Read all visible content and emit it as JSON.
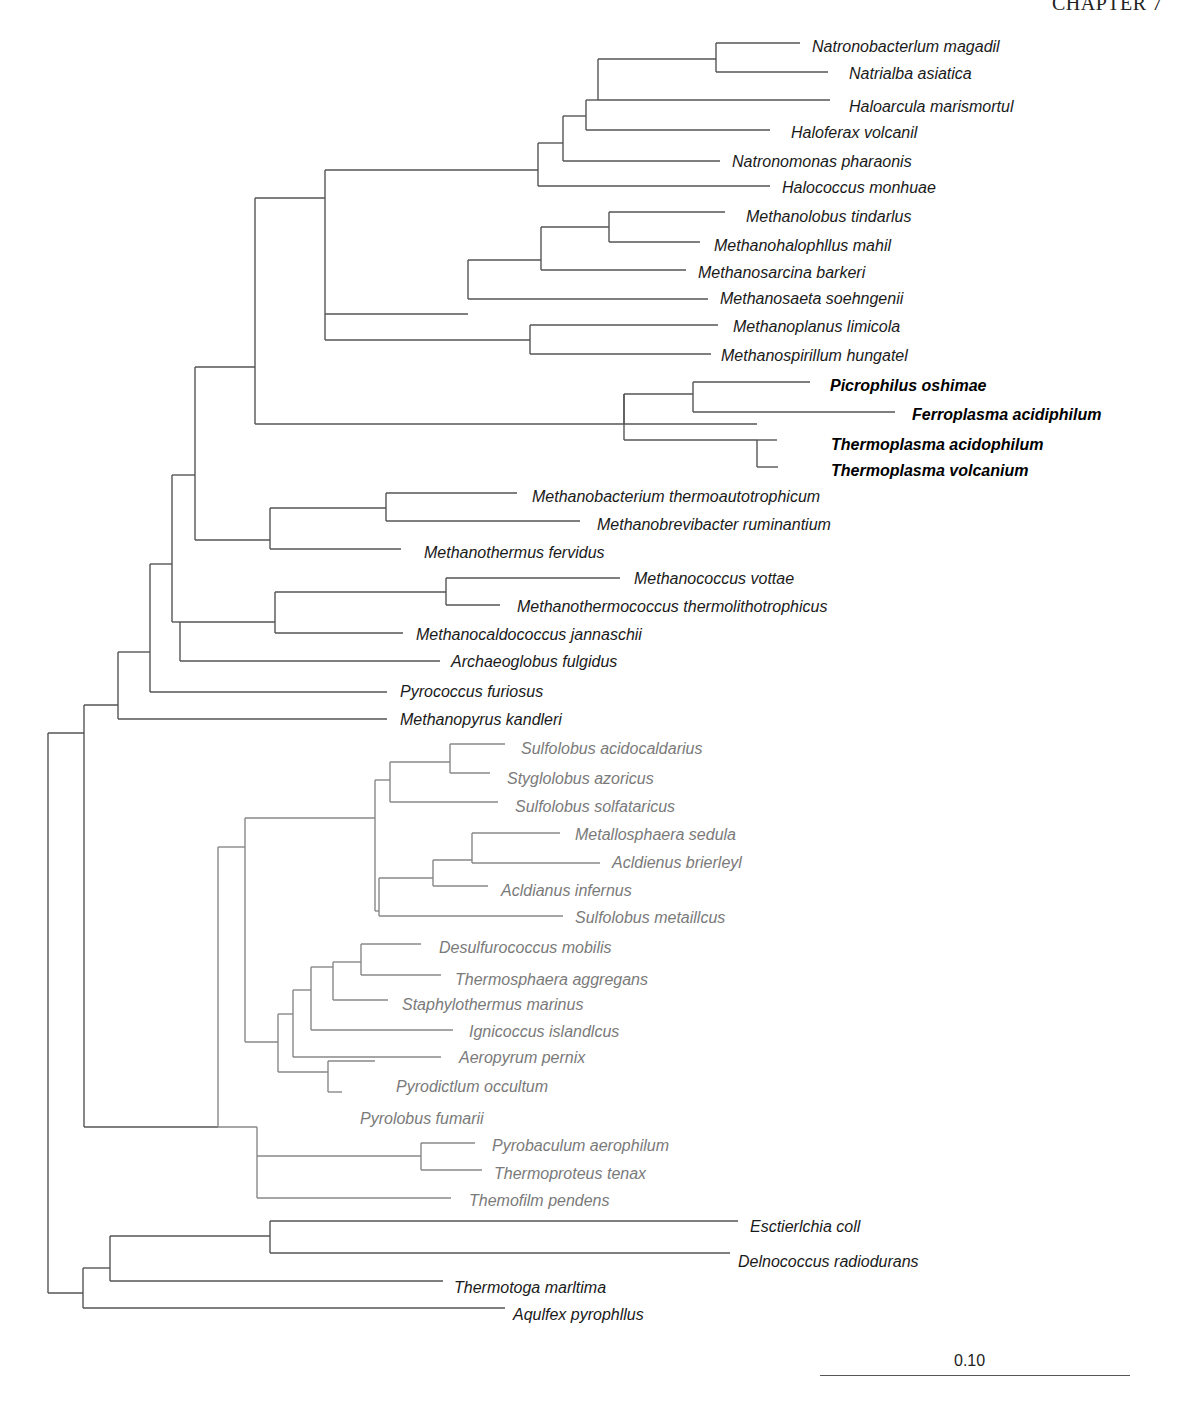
{
  "header": {
    "text": "CHAPTER 7"
  },
  "scale": {
    "label": "0.10"
  },
  "taxa": [
    {
      "name": "Natronobacterlum magadil",
      "group": "euryarchaeota",
      "style": "black",
      "x": 812,
      "y": 47
    },
    {
      "name": "Natrialba asiatica",
      "group": "euryarchaeota",
      "style": "black",
      "x": 849,
      "y": 74
    },
    {
      "name": "Haloarcula marismortul",
      "group": "euryarchaeota",
      "style": "black",
      "x": 849,
      "y": 107
    },
    {
      "name": "Haloferax volcanil",
      "group": "euryarchaeota",
      "style": "black",
      "x": 791,
      "y": 133
    },
    {
      "name": "Natronomonas pharaonis",
      "group": "euryarchaeota",
      "style": "black",
      "x": 732,
      "y": 162
    },
    {
      "name": "Halococcus monhuae",
      "group": "euryarchaeota",
      "style": "black",
      "x": 782,
      "y": 188
    },
    {
      "name": "Methanolobus tindarlus",
      "group": "euryarchaeota",
      "style": "black",
      "x": 746,
      "y": 217
    },
    {
      "name": "Methanohalophllus mahil",
      "group": "euryarchaeota",
      "style": "black",
      "x": 714,
      "y": 246
    },
    {
      "name": "Methanosarcina barkeri",
      "group": "euryarchaeota",
      "style": "black",
      "x": 698,
      "y": 273
    },
    {
      "name": "Methanosaeta soehngenii",
      "group": "euryarchaeota",
      "style": "black",
      "x": 720,
      "y": 299
    },
    {
      "name": "Methanoplanus limicola",
      "group": "euryarchaeota",
      "style": "black",
      "x": 733,
      "y": 327
    },
    {
      "name": "Methanospirillum hungatel",
      "group": "euryarchaeota",
      "style": "black",
      "x": 721,
      "y": 356
    },
    {
      "name": "Picrophilus oshimae",
      "group": "thermoplasmata",
      "style": "bold",
      "x": 830,
      "y": 386
    },
    {
      "name": "Ferroplasma acidiphilum",
      "group": "thermoplasmata",
      "style": "bold",
      "x": 912,
      "y": 415
    },
    {
      "name": "Thermoplasma acidophilum",
      "group": "thermoplasmata",
      "style": "bold",
      "x": 831,
      "y": 445
    },
    {
      "name": "Thermoplasma volcanium",
      "group": "thermoplasmata",
      "style": "bold",
      "x": 831,
      "y": 471
    },
    {
      "name": "Methanobacterium thermoautotrophicum",
      "group": "euryarchaeota",
      "style": "black",
      "x": 532,
      "y": 497
    },
    {
      "name": "Methanobrevibacter ruminantium",
      "group": "euryarchaeota",
      "style": "black",
      "x": 597,
      "y": 525
    },
    {
      "name": "Methanothermus fervidus",
      "group": "euryarchaeota",
      "style": "black",
      "x": 424,
      "y": 553
    },
    {
      "name": "Methanococcus vottae",
      "group": "euryarchaeota",
      "style": "black",
      "x": 634,
      "y": 579
    },
    {
      "name": "Methanothermococcus thermolithotrophicus",
      "group": "euryarchaeota",
      "style": "black",
      "x": 517,
      "y": 607
    },
    {
      "name": "Methanocaldococcus jannaschii",
      "group": "euryarchaeota",
      "style": "black",
      "x": 416,
      "y": 635
    },
    {
      "name": "Archaeoglobus fulgidus",
      "group": "euryarchaeota",
      "style": "black",
      "x": 451,
      "y": 662
    },
    {
      "name": "Pyrococcus furiosus",
      "group": "euryarchaeota",
      "style": "black",
      "x": 400,
      "y": 692
    },
    {
      "name": "Methanopyrus kandleri",
      "group": "euryarchaeota",
      "style": "black",
      "x": 400,
      "y": 720
    },
    {
      "name": "Sulfolobus acidocaldarius",
      "group": "crenarchaeota",
      "style": "gray",
      "x": 521,
      "y": 749
    },
    {
      "name": "Styglolobus azoricus",
      "group": "crenarchaeota",
      "style": "gray",
      "x": 507,
      "y": 779
    },
    {
      "name": "Sulfolobus solfataricus",
      "group": "crenarchaeota",
      "style": "gray",
      "x": 515,
      "y": 807
    },
    {
      "name": "Metallosphaera sedula",
      "group": "crenarchaeota",
      "style": "gray",
      "x": 575,
      "y": 835
    },
    {
      "name": "Acldienus brierleyl",
      "group": "crenarchaeota",
      "style": "gray",
      "x": 612,
      "y": 863
    },
    {
      "name": "Acldianus infernus",
      "group": "crenarchaeota",
      "style": "gray",
      "x": 501,
      "y": 891
    },
    {
      "name": "Sulfolobus metaillcus",
      "group": "crenarchaeota",
      "style": "gray",
      "x": 575,
      "y": 918
    },
    {
      "name": "Desulfurococcus mobilis",
      "group": "crenarchaeota",
      "style": "gray",
      "x": 439,
      "y": 948
    },
    {
      "name": "Thermosphaera aggregans",
      "group": "crenarchaeota",
      "style": "gray",
      "x": 455,
      "y": 980
    },
    {
      "name": "Staphylothermus marinus",
      "group": "crenarchaeota",
      "style": "gray",
      "x": 402,
      "y": 1005
    },
    {
      "name": "Ignicoccus islandlcus",
      "group": "crenarchaeota",
      "style": "gray",
      "x": 469,
      "y": 1032
    },
    {
      "name": "Aeropyrum pernix",
      "group": "crenarchaeota",
      "style": "gray",
      "x": 459,
      "y": 1058
    },
    {
      "name": "Pyrodictlum occultum",
      "group": "crenarchaeota",
      "style": "gray",
      "x": 396,
      "y": 1087
    },
    {
      "name": "Pyrolobus fumarii",
      "group": "crenarchaeota",
      "style": "gray",
      "x": 360,
      "y": 1119
    },
    {
      "name": "Pyrobaculum aerophilum",
      "group": "crenarchaeota",
      "style": "gray",
      "x": 492,
      "y": 1146
    },
    {
      "name": "Thermoproteus tenax",
      "group": "crenarchaeota",
      "style": "gray",
      "x": 494,
      "y": 1174
    },
    {
      "name": "Themofilm pendens",
      "group": "crenarchaeota",
      "style": "gray",
      "x": 469,
      "y": 1201
    },
    {
      "name": "Esctierlchia coll",
      "group": "bacteria",
      "style": "black",
      "x": 750,
      "y": 1227
    },
    {
      "name": "Delnococcus radiodurans",
      "group": "bacteria",
      "style": "black",
      "x": 738,
      "y": 1262
    },
    {
      "name": "Thermotoga marltima",
      "group": "bacteria",
      "style": "black",
      "x": 454,
      "y": 1288
    },
    {
      "name": "Aqulfex pyrophllus",
      "group": "bacteria",
      "style": "black",
      "x": 513,
      "y": 1315
    }
  ],
  "chart_data": {
    "type": "table",
    "scale_bar": {
      "label": "0.10",
      "length_px": 310
    },
    "groups": {
      "euryarchaeota_halobacteria": [
        "Natronobacterlum magadil",
        "Natrialba asiatica",
        "Haloarcula marismortul",
        "Haloferax volcanil",
        "Natronomonas pharaonis",
        "Halococcus monhuae"
      ],
      "euryarchaeota_methanosarcinales": [
        "Methanolobus tindarlus",
        "Methanohalophllus mahil",
        "Methanosarcina barkeri",
        "Methanosaeta soehngenii"
      ],
      "euryarchaeota_methanomicrobiales": [
        "Methanoplanus limicola",
        "Methanospirillum hungatel"
      ],
      "thermoplasmata_highlighted": [
        "Picrophilus oshimae",
        "Ferroplasma acidiphilum",
        "Thermoplasma acidophilum",
        "Thermoplasma volcanium"
      ],
      "euryarchaeota_methanobacteriales": [
        "Methanobacterium thermoautotrophicum",
        "Methanobrevibacter ruminantium",
        "Methanothermus fervidus"
      ],
      "euryarchaeota_methanococcales_archaeoglobales": [
        "Methanococcus vottae",
        "Methanothermococcus thermolithotrophicus",
        "Methanocaldococcus jannaschii",
        "Archaeoglobus fulgidus"
      ],
      "euryarchaeota_basal": [
        "Pyrococcus furiosus",
        "Methanopyrus kandleri"
      ],
      "crenarchaeota_sulfolobales": [
        "Sulfolobus acidocaldarius",
        "Styglolobus azoricus",
        "Sulfolobus solfataricus",
        "Metallosphaera sedula",
        "Acldienus brierleyl",
        "Acldianus infernus",
        "Sulfolobus metaillcus"
      ],
      "crenarchaeota_desulfurococcales": [
        "Desulfurococcus mobilis",
        "Thermosphaera aggregans",
        "Staphylothermus marinus",
        "Ignicoccus islandlcus",
        "Aeropyrum pernix",
        "Pyrodictlum occultum",
        "Pyrolobus fumarii"
      ],
      "crenarchaeota_thermoproteales": [
        "Pyrobaculum aerophilum",
        "Thermoproteus tenax",
        "Themofilm pendens"
      ],
      "bacteria_outgroup": [
        "Esctierlchia coll",
        "Delnococcus radiodurans",
        "Thermotoga marltima",
        "Aqulfex pyrophllus"
      ]
    },
    "newick": "((((((((((Natronobacterlum_magadil,Natrialba_asiatica),Haloarcula_marismortul),Haloferax_volcanil),Natronomonas_pharaonis),Halococcus_monhuae),(((Methanolobus_tindarlus,Methanohalophllus_mahil),Methanosarcina_barkeri),Methanosaeta_soehngenii),(Methanoplanus_limicola,Methanospirillum_hungatel)),((Picrophilus_oshimae,Ferroplasma_acidiphilum),(Thermoplasma_acidophilum,Thermoplasma_volcanium))),((Methanobacterium_thermoautotrophicum,Methanobrevibacter_ruminantium),Methanothermus_fervidus)),(((Methanococcus_vottae,Methanothermococcus_thermolithotrophicus),Methanocaldococcus_jannaschii),Archaeoglobus_fulgidus)),Pyrococcus_furiosus),Methanopyrus_kandleri),((((Sulfolobus_acidocaldarius,Styglolobus_azoricus),Sulfolobus_solfataricus),(((Metallosphaera_sedula,Acldienus_brierleyl),Acldianus_infernus),Sulfolobus_metaillcus)),(((((Desulfurococcus_mobilis,Thermosphaera_aggregans),Staphylothermus_marinus),Ignicoccus_islandlcus),Aeropyrum_pernix),(Pyrodictlum_occultum,Pyrolobus_fumarii))),((Pyrobaculum_aerophilum,Thermoproteus_tenax),Themofilm_pendens)),(((Esctierlchia_coll,Delnococcus_radiodurans),Thermotoga_marltima),Aqulfex_pyrophllus));"
  },
  "branches": {
    "dark": [
      "M48,733 V1293",
      "M48,733 H84",
      "M48,1293 H83",
      "M84,705 V1127",
      "M84,705 H118",
      "M84,1127 H218",
      "M118,652 V719",
      "M118,719 H387",
      "M118,652 H150",
      "M150,564 V692",
      "M150,692 H387",
      "M150,564 H172",
      "M172,475 V622",
      "M172,475 H195",
      "M195,367 V540",
      "M195,367 H255",
      "M255,198 V424",
      "M255,424 H624",
      "M255,198 H325",
      "M325,170 V314",
      "M325,170 H538",
      "M538,143 V186",
      "M538,143 H563",
      "M563,116 V161",
      "M563,161 H720",
      "M563,116 H586",
      "M586,100 V130",
      "M586,130 H770",
      "M586,100 H598",
      "M598,59 V100",
      "M598,59 H716",
      "M598,100 H830",
      "M716,43 V72",
      "M716,43 H800",
      "M716,72 H828",
      "M538,186 H770",
      "M325,314 H468",
      "M468,260 V299",
      "M468,260 H541",
      "M541,227 V270",
      "M541,270 H686",
      "M541,227 H609",
      "M609,212 V242",
      "M609,212 H725",
      "M609,242 H700",
      "M468,299 H708",
      "M389,340 H530",
      "M530,325 V354",
      "M530,325 H718",
      "M530,354 H711",
      "M325,314 V340",
      "M325,340 H389",
      "M624,394 V424",
      "M624,394 H693",
      "M693,382 V412",
      "M693,382 H810",
      "M693,412 H895",
      "M624,424 H757",
      "M757,440 V467",
      "M757,440 H777",
      "M757,467 H778",
      "M624,394 V440",
      "M624,440 H757",
      "M195,540 H270",
      "M270,508 V549",
      "M270,508 H386",
      "M386,493 V521",
      "M386,493 H517",
      "M386,521 H580",
      "M270,549 H401",
      "M172,622 H180",
      "M180,622 V661",
      "M180,661 H440",
      "M180,622 H275",
      "M275,592 V633",
      "M275,592 H446",
      "M446,578 V605",
      "M446,578 H620",
      "M446,605 H500",
      "M275,633 H403",
      "M83,1268 H110",
      "M83,1268 V1308",
      "M83,1308 H505",
      "M110,1236 V1281",
      "M110,1236 H270",
      "M110,1281 H443",
      "M270,1221 V1253",
      "M270,1221 H738",
      "M270,1253 H730"
    ],
    "cren": [
      "M218,847 V1127",
      "M218,847 H245",
      "M245,818 V1042",
      "M245,818 H375",
      "M375,780 V911",
      "M375,780 H390",
      "M390,762 V802",
      "M390,762 H450",
      "M450,744 V773",
      "M450,744 H505",
      "M450,773 H490",
      "M390,802 H498",
      "M375,911 H379",
      "M379,878 V916",
      "M379,878 H433",
      "M433,860 V886",
      "M433,860 H472",
      "M472,833 V863",
      "M472,833 H560",
      "M472,863 H600",
      "M433,886 H488",
      "M379,916 H563",
      "M245,1042 H278",
      "M278,1014 V1072",
      "M278,1014 H293",
      "M293,990 V1057",
      "M293,990 H311",
      "M311,967 V1030",
      "M311,967 H333",
      "M333,962 V1000",
      "M333,962 H361",
      "M361,944 V975",
      "M361,944 H421",
      "M361,975 H441",
      "M333,1000 H388",
      "M311,1030 H453",
      "M293,1057 H441",
      "M278,1072 H328",
      "M328,1061 V1092",
      "M328,1061 H375",
      "M328,1092 H342",
      "M218,1127 H257",
      "M257,1156 V1198",
      "M257,1127 V1156",
      "M257,1156 H421",
      "M421,1143 V1170",
      "M421,1143 H475",
      "M421,1170 H482",
      "M257,1198 H451"
    ]
  }
}
